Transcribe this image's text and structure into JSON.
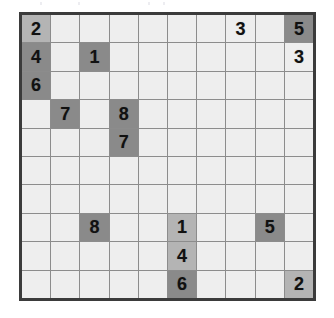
{
  "puzzle": {
    "type": "number-grid-puzzle",
    "rows": 10,
    "columns": 10,
    "colors": {
      "border": "#3b3b3b",
      "gridline": "#8c8c8c",
      "cell_light": "#eeeeee",
      "cell_medium": "#b4b4b4",
      "cell_dark": "#8a8a8a",
      "digit": "#111111"
    },
    "shade_levels": [
      "light",
      "medium",
      "dark"
    ],
    "cells": [
      [
        {
          "value": "2",
          "shade": "medium"
        },
        {
          "value": "",
          "shade": "light"
        },
        {
          "value": "",
          "shade": "light"
        },
        {
          "value": "",
          "shade": "light"
        },
        {
          "value": "",
          "shade": "light"
        },
        {
          "value": "",
          "shade": "light"
        },
        {
          "value": "",
          "shade": "light"
        },
        {
          "value": "3",
          "shade": "light"
        },
        {
          "value": "",
          "shade": "light"
        },
        {
          "value": "5",
          "shade": "dark"
        }
      ],
      [
        {
          "value": "4",
          "shade": "dark"
        },
        {
          "value": "",
          "shade": "light"
        },
        {
          "value": "1",
          "shade": "dark"
        },
        {
          "value": "",
          "shade": "light"
        },
        {
          "value": "",
          "shade": "light"
        },
        {
          "value": "",
          "shade": "light"
        },
        {
          "value": "",
          "shade": "light"
        },
        {
          "value": "",
          "shade": "light"
        },
        {
          "value": "",
          "shade": "light"
        },
        {
          "value": "3",
          "shade": "light"
        }
      ],
      [
        {
          "value": "6",
          "shade": "dark"
        },
        {
          "value": "",
          "shade": "light"
        },
        {
          "value": "",
          "shade": "light"
        },
        {
          "value": "",
          "shade": "light"
        },
        {
          "value": "",
          "shade": "light"
        },
        {
          "value": "",
          "shade": "light"
        },
        {
          "value": "",
          "shade": "light"
        },
        {
          "value": "",
          "shade": "light"
        },
        {
          "value": "",
          "shade": "light"
        },
        {
          "value": "",
          "shade": "light"
        }
      ],
      [
        {
          "value": "",
          "shade": "light"
        },
        {
          "value": "7",
          "shade": "dark"
        },
        {
          "value": "",
          "shade": "light"
        },
        {
          "value": "8",
          "shade": "dark"
        },
        {
          "value": "",
          "shade": "light"
        },
        {
          "value": "",
          "shade": "light"
        },
        {
          "value": "",
          "shade": "light"
        },
        {
          "value": "",
          "shade": "light"
        },
        {
          "value": "",
          "shade": "light"
        },
        {
          "value": "",
          "shade": "light"
        }
      ],
      [
        {
          "value": "",
          "shade": "light"
        },
        {
          "value": "",
          "shade": "light"
        },
        {
          "value": "",
          "shade": "light"
        },
        {
          "value": "7",
          "shade": "dark"
        },
        {
          "value": "",
          "shade": "light"
        },
        {
          "value": "",
          "shade": "light"
        },
        {
          "value": "",
          "shade": "light"
        },
        {
          "value": "",
          "shade": "light"
        },
        {
          "value": "",
          "shade": "light"
        },
        {
          "value": "",
          "shade": "light"
        }
      ],
      [
        {
          "value": "",
          "shade": "light"
        },
        {
          "value": "",
          "shade": "light"
        },
        {
          "value": "",
          "shade": "light"
        },
        {
          "value": "",
          "shade": "light"
        },
        {
          "value": "",
          "shade": "light"
        },
        {
          "value": "",
          "shade": "light"
        },
        {
          "value": "",
          "shade": "light"
        },
        {
          "value": "",
          "shade": "light"
        },
        {
          "value": "",
          "shade": "light"
        },
        {
          "value": "",
          "shade": "light"
        }
      ],
      [
        {
          "value": "",
          "shade": "light"
        },
        {
          "value": "",
          "shade": "light"
        },
        {
          "value": "",
          "shade": "light"
        },
        {
          "value": "",
          "shade": "light"
        },
        {
          "value": "",
          "shade": "light"
        },
        {
          "value": "",
          "shade": "light"
        },
        {
          "value": "",
          "shade": "light"
        },
        {
          "value": "",
          "shade": "light"
        },
        {
          "value": "",
          "shade": "light"
        },
        {
          "value": "",
          "shade": "light"
        }
      ],
      [
        {
          "value": "",
          "shade": "light"
        },
        {
          "value": "",
          "shade": "light"
        },
        {
          "value": "8",
          "shade": "dark"
        },
        {
          "value": "",
          "shade": "light"
        },
        {
          "value": "",
          "shade": "light"
        },
        {
          "value": "1",
          "shade": "medium"
        },
        {
          "value": "",
          "shade": "light"
        },
        {
          "value": "",
          "shade": "light"
        },
        {
          "value": "5",
          "shade": "dark"
        },
        {
          "value": "",
          "shade": "light"
        }
      ],
      [
        {
          "value": "",
          "shade": "light"
        },
        {
          "value": "",
          "shade": "light"
        },
        {
          "value": "",
          "shade": "light"
        },
        {
          "value": "",
          "shade": "light"
        },
        {
          "value": "",
          "shade": "light"
        },
        {
          "value": "4",
          "shade": "medium"
        },
        {
          "value": "",
          "shade": "light"
        },
        {
          "value": "",
          "shade": "light"
        },
        {
          "value": "",
          "shade": "light"
        },
        {
          "value": "",
          "shade": "light"
        }
      ],
      [
        {
          "value": "",
          "shade": "light"
        },
        {
          "value": "",
          "shade": "light"
        },
        {
          "value": "",
          "shade": "light"
        },
        {
          "value": "",
          "shade": "light"
        },
        {
          "value": "",
          "shade": "light"
        },
        {
          "value": "6",
          "shade": "dark"
        },
        {
          "value": "",
          "shade": "light"
        },
        {
          "value": "",
          "shade": "light"
        },
        {
          "value": "",
          "shade": "light"
        },
        {
          "value": "2",
          "shade": "medium"
        }
      ]
    ]
  }
}
